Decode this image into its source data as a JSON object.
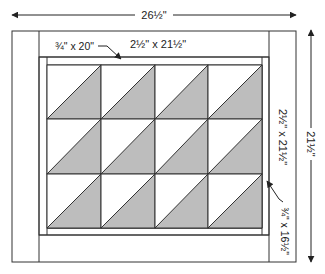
{
  "diagram": {
    "type": "quilt-layout",
    "overall_width_label": "26½\"",
    "overall_height_label": "21½\"",
    "labels": {
      "inner_sashing_top": "¾\" x 20\"",
      "outer_border_top": "2½\" x 21½\"",
      "outer_border_side": "2½\" x 21½\"",
      "inner_sashing_side": "¾\" x 16½\""
    },
    "grid": {
      "rows": 3,
      "cols": 4,
      "block_style": "half-square-triangle",
      "diagonal": "bottom-left to top-right",
      "shaded_half": "lower-right"
    },
    "colors": {
      "line": "#333333",
      "shade": "#bdbdbd",
      "background": "#ffffff"
    }
  }
}
